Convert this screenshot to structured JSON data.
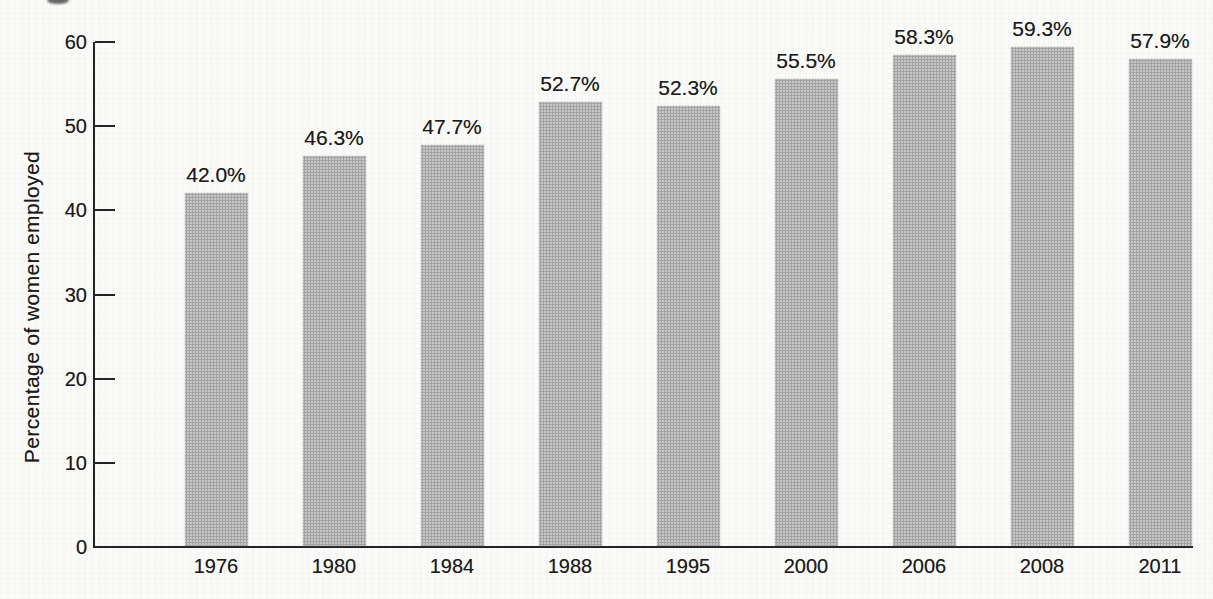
{
  "figure": {
    "ylabel": "Percentage of women employed"
  },
  "colors": {
    "background": "#fafaf8",
    "bar_fill": "#c7c7c7",
    "bar_halftone_dot": "#8a8a8a",
    "axis": "#242424",
    "text": "#1c1c1c"
  },
  "chart_data": {
    "type": "bar",
    "title": "",
    "xlabel": "",
    "ylabel": "Percentage of women employed",
    "categories": [
      "1976",
      "1980",
      "1984",
      "1988",
      "1995",
      "2000",
      "2006",
      "2008",
      "2011"
    ],
    "values": [
      42.0,
      46.3,
      47.7,
      52.7,
      52.3,
      55.5,
      58.3,
      59.3,
      57.9
    ],
    "data_labels": [
      "42.0%",
      "46.3%",
      "47.7%",
      "52.7%",
      "52.3%",
      "55.5%",
      "58.3%",
      "59.3%",
      "57.9%"
    ],
    "ylim": [
      0,
      60
    ],
    "yticks": [
      "0",
      "10",
      "20",
      "30",
      "40",
      "50",
      "60"
    ],
    "grid": false,
    "legend": false
  }
}
